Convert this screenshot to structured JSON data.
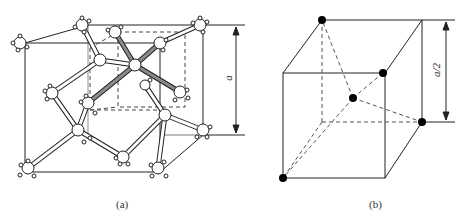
{
  "panels": {
    "a": {
      "caption": "(a)",
      "dimension_label": "a",
      "description": "Diamond cubic crystal structure unit cell with tetrahedral bonds; highlighted bonds show one tetrahedral unit inside a dashed sub-cube"
    },
    "b": {
      "caption": "(b)",
      "dimension_label": "a/2",
      "description": "Sub-cube of edge a/2 showing a central atom tetrahedrally bonded to four corner atoms (dashed lines)"
    }
  },
  "colors": {
    "line": "#222222",
    "highlight_bond": "#888888",
    "atom_fill": "#ffffff",
    "dot_fill": "#000000"
  }
}
